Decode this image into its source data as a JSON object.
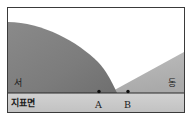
{
  "figure": {
    "type": "geologic-cross-section",
    "title": "",
    "frame": {
      "x": 7,
      "y": 7,
      "width": 178,
      "height": 106,
      "border_color": "#3a3a3a",
      "background_color": "#ffffff"
    },
    "ground_line": {
      "y": 93,
      "color": "#2b2b2b",
      "band_fill": "#c9c9c9",
      "band_top": 93,
      "band_bottom": 113
    },
    "layers": [
      {
        "id": "west-dome",
        "name": "dark-rock-body-west",
        "fill": "#7c7c7c",
        "description": "large dark grey dome shaped rock body occupying the west side"
      },
      {
        "id": "east-wedge",
        "name": "light-rock-body-east",
        "fill": "#b2b2b2",
        "description": "light grey wedge dipping down to the west on the east side"
      },
      {
        "id": "air-gap",
        "name": "white-region",
        "fill": "#ffffff",
        "description": "white unshaded region between the dome and the wedge"
      }
    ],
    "points": [
      {
        "id": "A",
        "label": "A",
        "x": 99,
        "y": 93,
        "marker": "dot"
      },
      {
        "id": "B",
        "label": "B",
        "x": 128,
        "y": 93,
        "marker": "dot"
      }
    ]
  },
  "labels": {
    "west": "서",
    "east": "동",
    "ground": "지표면",
    "point_a": "A",
    "point_b": "B"
  },
  "colors": {
    "dark_rock": "#7c7c7c",
    "light_rock": "#b2b2b2",
    "ground_band": "#c9c9c9",
    "frame_border": "#3a3a3a",
    "text": "#1a1a1a"
  }
}
